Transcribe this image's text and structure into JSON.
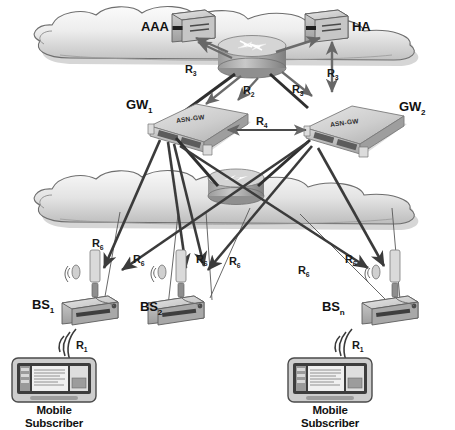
{
  "diagram": {
    "colors": {
      "cloud_fill_light": "#f2f2f2",
      "cloud_fill_mid": "#cfcfcf",
      "cloud_edge": "#6e6e6e",
      "device_light": "#e6e6e6",
      "device_mid": "#b9b9b9",
      "device_dark": "#8a8a8a",
      "arrow_dark": "#3b3b3b",
      "arrow_mid": "#6b6b6b",
      "link_thin": "#585858",
      "text": "#111111"
    }
  },
  "nodes": {
    "aaa": {
      "label": "AAA",
      "type": "server"
    },
    "ha": {
      "label": "HA",
      "type": "server"
    },
    "gw1": {
      "label": "GW",
      "sub": "1",
      "device_label": "ASN-GW"
    },
    "gw2": {
      "label": "GW",
      "sub": "2",
      "device_label": "ASN-GW"
    },
    "bs1": {
      "label": "BS",
      "sub": "1"
    },
    "bs2": {
      "label": "BS",
      "sub": "2"
    },
    "bsn": {
      "label": "BS",
      "sub": "n"
    },
    "ms1": {
      "label": "Mobile Subscriber"
    },
    "ms2": {
      "label": "Mobile Subscriber"
    },
    "router_top": {
      "label": "",
      "type": "router"
    },
    "router_bottom": {
      "label": "",
      "type": "router"
    }
  },
  "reference_points": {
    "r1a": {
      "label": "R",
      "sub": "1"
    },
    "r1b": {
      "label": "R",
      "sub": "1"
    },
    "r2": {
      "label": "R",
      "sub": "2"
    },
    "r3a": {
      "label": "R",
      "sub": "3"
    },
    "r3b": {
      "label": "R",
      "sub": "3"
    },
    "r3c": {
      "label": "R",
      "sub": "3"
    },
    "r4": {
      "label": "R",
      "sub": "4"
    },
    "r6a": {
      "label": "R",
      "sub": "6"
    },
    "r6b": {
      "label": "R",
      "sub": "6"
    },
    "r6c": {
      "label": "R",
      "sub": "6"
    },
    "r6d": {
      "label": "R",
      "sub": "6"
    },
    "r6e": {
      "label": "R",
      "sub": "6"
    },
    "r6f": {
      "label": "R",
      "sub": "6"
    }
  }
}
